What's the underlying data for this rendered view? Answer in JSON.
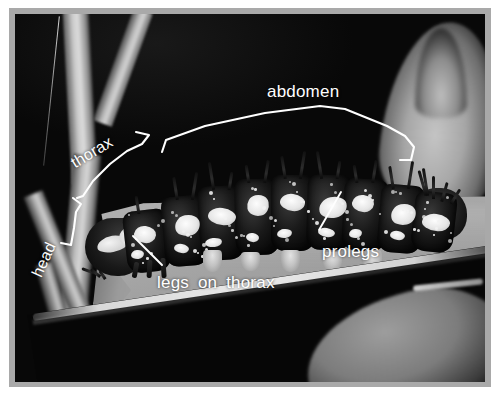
{
  "figure": {
    "kind": "labeled-photograph",
    "frame_color": "#a9a9a9",
    "mat_color": "#ffffff",
    "annotation_color": "#ffffff"
  },
  "annotations": {
    "abdomen": {
      "label": "abdomen",
      "type": "bracket",
      "note": "long white bracket spanning the rear body segments along the top"
    },
    "thorax": {
      "label": "thorax",
      "type": "bracket",
      "rotation_deg": -31,
      "note": "angled bracket over the three segments behind the head"
    },
    "head": {
      "label": "head",
      "type": "bracket",
      "rotation_deg": -66,
      "note": "small vertical bracket at the front of the animal"
    },
    "prolegs": {
      "label": "prolegs",
      "type": "leader-line",
      "note": "diagonal leader pointing up-right to a fleshy abdominal proleg"
    },
    "legs_on_thorax": {
      "label": "legs on thorax",
      "type": "leader-line",
      "note": "diagonal leader pointing up-left to the true legs behind the head"
    }
  },
  "scene": {
    "background": "dark",
    "elements": [
      "plant stem forking at upper left",
      "upright pale leaf at upper right",
      "broad pale leaf the caterpillar rests on",
      "torn ragged leaf edge at lower left",
      "bright rim light along the lower leaf margin",
      "second shaded leaf at lower right"
    ]
  },
  "caterpillar": {
    "segments": 9,
    "description": "dark body with large white saddle patches, scattered white speckles, paired black spines on each segment",
    "appendages": {
      "prolegs": 5,
      "thoracic_legs": 3
    }
  }
}
